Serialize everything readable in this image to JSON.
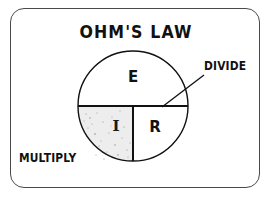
{
  "figure": {
    "title": "OHM'S LAW",
    "frame_color": "#4a4a4a",
    "background_color": "#ffffff",
    "ink_color": "#111111"
  },
  "labels": {
    "divide": "DIVIDE",
    "multiply": "MULTIPLY"
  },
  "wheel": {
    "center_x": 133,
    "center_y": 106,
    "radius": 55,
    "segments": [
      {
        "id": "voltage",
        "letter": "E",
        "position": "top-half",
        "fill": "#ffffff"
      },
      {
        "id": "current",
        "letter": "I",
        "position": "bottom-left-quarter",
        "fill": "#ededed"
      },
      {
        "id": "resistance",
        "letter": "R",
        "position": "bottom-right-quarter",
        "fill": "#ffffff"
      }
    ]
  },
  "leader_line": {
    "from_x": 204,
    "from_y": 76,
    "to_x": 163,
    "to_y": 106
  }
}
